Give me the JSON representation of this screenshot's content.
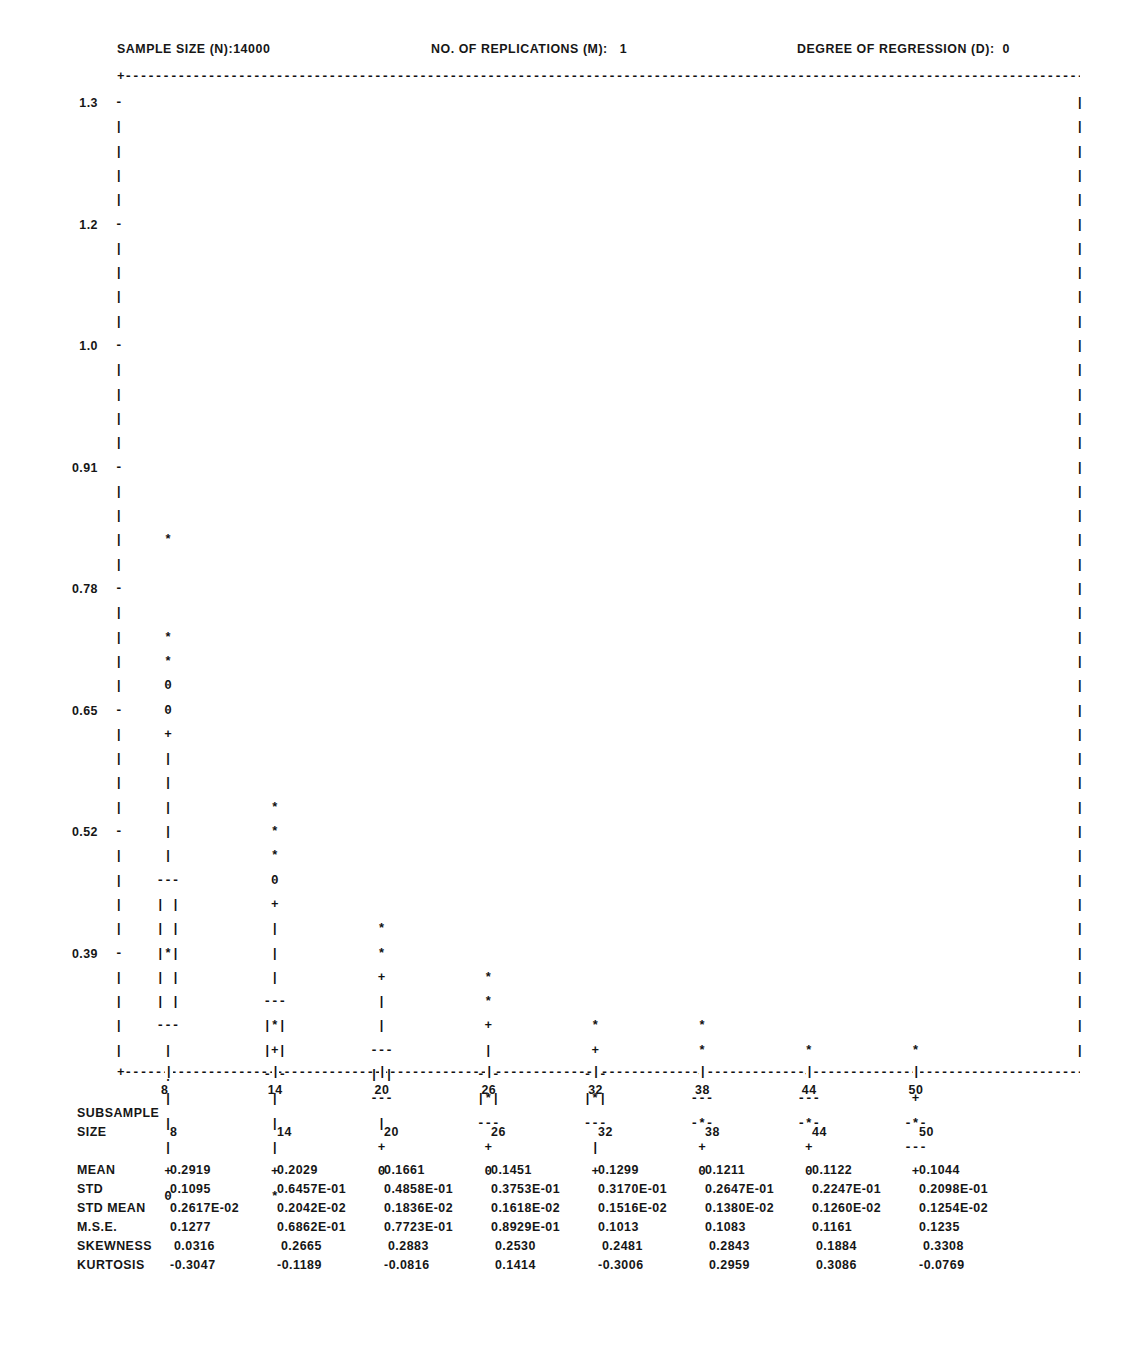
{
  "header": {
    "sample_size": "SAMPLE SIZE (N):14000",
    "replications": "NO. OF REPLICATIONS (M):   1",
    "degree": "DEGREE OF REGRESSION (D):  0"
  },
  "axes": {
    "y_ticks": [
      "1.3",
      "1.2",
      "1.0",
      "0.91",
      "0.78",
      "0.65",
      "0.52",
      "0.39",
      "0.25",
      "0.12"
    ],
    "x_ticks": [
      "8",
      "14",
      "20",
      "26",
      "32",
      "38",
      "44",
      "50"
    ]
  },
  "stats": {
    "header_line1": "SUBSAMPLE",
    "header_line2": "SIZE",
    "row_labels": [
      "MEAN",
      "STD",
      "STD MEAN",
      "M.S.E.",
      "SKEWNESS",
      "KURTOSIS"
    ],
    "sizes": [
      "8",
      "14",
      "20",
      "26",
      "32",
      "38",
      "44",
      "50"
    ],
    "rows": [
      [
        "0.2919",
        "0.2029",
        "0.1661",
        "0.1451",
        "0.1299",
        "0.1211",
        "0.1122",
        "0.1044"
      ],
      [
        "0.1095",
        "0.6457E-01",
        "0.4858E-01",
        "0.3753E-01",
        "0.3170E-01",
        "0.2647E-01",
        "0.2247E-01",
        "0.2098E-01"
      ],
      [
        "0.2617E-02",
        "0.2042E-02",
        "0.1836E-02",
        "0.1618E-02",
        "0.1516E-02",
        "0.1380E-02",
        "0.1260E-02",
        "0.1254E-02"
      ],
      [
        "0.1277",
        "0.6862E-01",
        "0.7723E-01",
        "0.8929E-01",
        "0.1013",
        "0.1083",
        "0.1161",
        "0.1235"
      ],
      [
        " 0.0316",
        " 0.2665",
        " 0.2883",
        " 0.2530",
        " 0.2481",
        " 0.2843",
        " 0.1884",
        " 0.3308"
      ],
      [
        "-0.3047",
        "-0.1189",
        "-0.0816",
        " 0.1414",
        "-0.3006",
        " 0.2959",
        " 0.3086",
        "-0.0769"
      ]
    ]
  },
  "chart_data": {
    "type": "box",
    "xlabel": "SUBSAMPLE SIZE",
    "ylabel": "",
    "ylim": [
      0.0,
      1.36
    ],
    "xlim": [
      5,
      56
    ],
    "grid": false,
    "legend": "none",
    "categories": [
      8,
      14,
      20,
      26,
      32,
      38,
      44,
      50
    ],
    "symbols": {
      "asterisk": "extreme / outlier value",
      "zero": "minimum or maximum observed",
      "plus": "whisker endpoint",
      "pipe": "whisker line",
      "dashes": "quartile (box edge)",
      "boxed-asterisk": "median inside box"
    },
    "series": [
      {
        "name": "MEAN",
        "values": [
          0.2919,
          0.2029,
          0.1661,
          0.1451,
          0.1299,
          0.1211,
          0.1122,
          0.1044
        ]
      },
      {
        "name": "STD",
        "values": [
          0.1095,
          0.06457,
          0.04858,
          0.03753,
          0.0317,
          0.02647,
          0.02247,
          0.02098
        ]
      },
      {
        "name": "STD MEAN",
        "values": [
          0.002617,
          0.002042,
          0.001836,
          0.001618,
          0.001516,
          0.00138,
          0.00126,
          0.001254
        ]
      },
      {
        "name": "M.S.E.",
        "values": [
          0.1277,
          0.06862,
          0.07723,
          0.08929,
          0.1013,
          0.1083,
          0.1161,
          0.1235
        ]
      },
      {
        "name": "SKEWNESS",
        "values": [
          0.0316,
          0.2665,
          0.2883,
          0.253,
          0.2481,
          0.2843,
          0.1884,
          0.3308
        ]
      },
      {
        "name": "KURTOSIS",
        "values": [
          -0.3047,
          -0.1189,
          -0.0816,
          0.1414,
          -0.3006,
          0.2959,
          0.3086,
          -0.0769
        ]
      }
    ],
    "boxes": [
      {
        "size": 8,
        "upper_outliers_y": [
          0.72,
          0.645,
          0.62
        ],
        "max_y": 0.595,
        "max2_y": 0.57,
        "whisker_top_y": 0.545,
        "q3_y": 0.375,
        "median_y": 0.3,
        "q1_y": 0.225,
        "whisker_bottom_y": 0.075,
        "min_y": 0.05
      },
      {
        "size": 14,
        "upper_outliers_y": [
          0.455,
          0.43,
          0.405
        ],
        "max_y": 0.38,
        "whisker_top_y": 0.355,
        "q3_y": 0.235,
        "median_y": 0.21,
        "q1_y": 0.185,
        "whisker_bottom_y": 0.075
      },
      {
        "size": 20,
        "upper_outliers_y": [
          0.3,
          0.275
        ],
        "whisker_top_y": 0.25,
        "q3_y": 0.185,
        "median_y": 0.16,
        "q1_y": 0.135,
        "whisker_bottom_y": 0.075,
        "min_y": 0.05,
        "min2_y": 0.03
      },
      {
        "size": 26,
        "upper_outliers_y": [
          0.255,
          0.23
        ],
        "whisker_top_y": 0.205,
        "q3_y": 0.16,
        "median_y": 0.135,
        "q1_y": 0.11,
        "whisker_bottom_y": 0.075,
        "min_y": 0.05
      },
      {
        "size": 32,
        "upper_outliers_y": [
          0.21
        ],
        "whisker_top_y": 0.185,
        "q3_y": 0.16,
        "median_y": 0.135,
        "q1_y": 0.11,
        "whisker_bottom_y": 0.075,
        "min_y": 0.05
      },
      {
        "size": 38,
        "upper_outliers_y": [
          0.21
        ],
        "whisker_top_y": 0.185,
        "q3_y": 0.16,
        "median_y": 0.135,
        "q1_y": 0.11,
        "whisker_bottom_y": 0.075,
        "min_y": 0.05
      },
      {
        "size": 44,
        "upper_outliers_y": [
          0.185
        ],
        "whisker_top_y": 0.16,
        "q3_y": 0.135,
        "median_y": 0.11,
        "q1_y": 0.085,
        "whisker_bottom_y": 0.075,
        "min_y": 0.05
      },
      {
        "size": 50,
        "upper_outliers_y": [
          0.185,
          0.16
        ],
        "whisker_top_y": 0.135,
        "q3_y": 0.11,
        "median_y": 0.085,
        "q1_y": 0.06,
        "whisker_bottom_y": 0.05
      }
    ]
  },
  "plot_grid": {
    "comment": "Row-by-row ASCII glyphs. Each entry: [row_index, column_index, glyph]. column_index 0..7 maps to subsample sizes 8..50.",
    "cells": [
      [
        18,
        0,
        "*"
      ],
      [
        22,
        0,
        "*"
      ],
      [
        23,
        0,
        "*"
      ],
      [
        24,
        0,
        "0"
      ],
      [
        25,
        0,
        "0"
      ],
      [
        26,
        0,
        "+"
      ],
      [
        27,
        0,
        "|"
      ],
      [
        28,
        0,
        "|"
      ],
      [
        29,
        0,
        "|"
      ],
      [
        30,
        0,
        "|"
      ],
      [
        31,
        0,
        "|"
      ],
      [
        32,
        0,
        "---"
      ],
      [
        33,
        0,
        "| |"
      ],
      [
        34,
        0,
        "| |"
      ],
      [
        35,
        0,
        "|*|"
      ],
      [
        36,
        0,
        "| |"
      ],
      [
        37,
        0,
        "| |"
      ],
      [
        38,
        0,
        "---"
      ],
      [
        39,
        0,
        "|"
      ],
      [
        40,
        0,
        "|"
      ],
      [
        41,
        0,
        "|"
      ],
      [
        42,
        0,
        "|"
      ],
      [
        43,
        0,
        "|"
      ],
      [
        44,
        0,
        "+"
      ],
      [
        45,
        0,
        "0"
      ],
      [
        29,
        1,
        "*"
      ],
      [
        30,
        1,
        "*"
      ],
      [
        31,
        1,
        "*"
      ],
      [
        32,
        1,
        "0"
      ],
      [
        33,
        1,
        "+"
      ],
      [
        34,
        1,
        "|"
      ],
      [
        35,
        1,
        "|"
      ],
      [
        36,
        1,
        "|"
      ],
      [
        37,
        1,
        "---"
      ],
      [
        38,
        1,
        "|*|"
      ],
      [
        39,
        1,
        "|+|"
      ],
      [
        40,
        1,
        "---"
      ],
      [
        41,
        1,
        "|"
      ],
      [
        42,
        1,
        "|"
      ],
      [
        43,
        1,
        "|"
      ],
      [
        44,
        1,
        "+"
      ],
      [
        45,
        1,
        "*"
      ],
      [
        34,
        2,
        "*"
      ],
      [
        35,
        2,
        "*"
      ],
      [
        36,
        2,
        "+"
      ],
      [
        37,
        2,
        "|"
      ],
      [
        38,
        2,
        "|"
      ],
      [
        39,
        2,
        "---"
      ],
      [
        40,
        2,
        "|*|"
      ],
      [
        41,
        2,
        "---"
      ],
      [
        42,
        2,
        "|"
      ],
      [
        43,
        2,
        "+"
      ],
      [
        44,
        2,
        "0"
      ],
      [
        36,
        3,
        "*"
      ],
      [
        37,
        3,
        "*"
      ],
      [
        38,
        3,
        "+"
      ],
      [
        39,
        3,
        "|"
      ],
      [
        40,
        3,
        "---"
      ],
      [
        41,
        3,
        "|*|"
      ],
      [
        42,
        3,
        "---"
      ],
      [
        43,
        3,
        "+"
      ],
      [
        44,
        3,
        "0"
      ],
      [
        38,
        4,
        "*"
      ],
      [
        39,
        4,
        "+"
      ],
      [
        40,
        4,
        "---"
      ],
      [
        41,
        4,
        "|*|"
      ],
      [
        42,
        4,
        "---"
      ],
      [
        43,
        4,
        "|"
      ],
      [
        44,
        4,
        "+"
      ],
      [
        38,
        5,
        "*"
      ],
      [
        39,
        5,
        "*"
      ],
      [
        40,
        5,
        "+"
      ],
      [
        41,
        5,
        "---"
      ],
      [
        42,
        5,
        "-*-"
      ],
      [
        43,
        5,
        "+"
      ],
      [
        44,
        5,
        "0"
      ],
      [
        39,
        6,
        "*"
      ],
      [
        40,
        6,
        "+"
      ],
      [
        41,
        6,
        "---"
      ],
      [
        42,
        6,
        "-*-"
      ],
      [
        43,
        6,
        "+"
      ],
      [
        44,
        6,
        "0"
      ],
      [
        39,
        7,
        "*"
      ],
      [
        40,
        7,
        "*"
      ],
      [
        41,
        7,
        "+"
      ],
      [
        42,
        7,
        "-*-"
      ],
      [
        43,
        7,
        "---"
      ],
      [
        44,
        7,
        "+"
      ]
    ]
  }
}
